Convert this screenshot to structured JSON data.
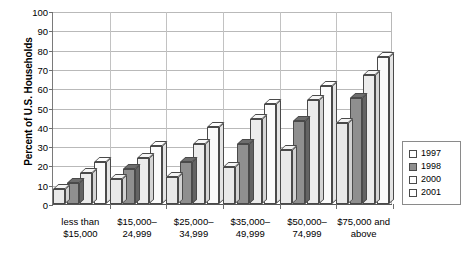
{
  "chart_data": {
    "type": "bar",
    "title": "",
    "xlabel": "",
    "ylabel": "Percent of U.S. Households",
    "ylim": [
      0,
      100
    ],
    "yticks": [
      0,
      10,
      20,
      30,
      40,
      50,
      60,
      70,
      80,
      90,
      100
    ],
    "grid": true,
    "legend_position": "right",
    "categories": [
      "less than $15,000",
      "$15,000–24,999",
      "$25,000–34,999",
      "$35,000–49,999",
      "$50,000–74,999",
      "$75,000 and above"
    ],
    "category_lines": [
      [
        "less than",
        "$15,000"
      ],
      [
        "$15,000–",
        "24,999"
      ],
      [
        "$25,000–",
        "34,999"
      ],
      [
        "$35,000–",
        "49,999"
      ],
      [
        "$50,000–",
        "74,999"
      ],
      [
        "$75,000 and",
        "above"
      ]
    ],
    "series": [
      {
        "name": "1997",
        "values": [
          8,
          13,
          14,
          19,
          28,
          42
        ]
      },
      {
        "name": "1998",
        "values": [
          11,
          18,
          22,
          31,
          43,
          55
        ]
      },
      {
        "name": "2000",
        "values": [
          16,
          24,
          31,
          44,
          54,
          67
        ]
      },
      {
        "name": "2001",
        "values": [
          22,
          30,
          40,
          52,
          61,
          76
        ]
      }
    ]
  },
  "legend": {
    "items": [
      {
        "label": "1997"
      },
      {
        "label": "1998"
      },
      {
        "label": "2000"
      },
      {
        "label": "2001"
      }
    ]
  },
  "axis": {
    "y_title": "Percent of U.S. Households"
  }
}
